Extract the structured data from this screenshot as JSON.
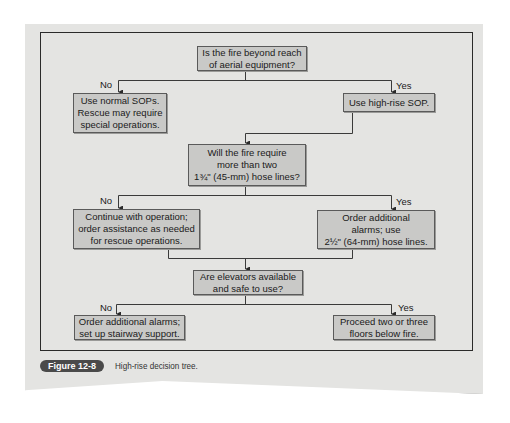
{
  "diagram": {
    "type": "decision-tree",
    "nodes": {
      "q1": {
        "text": "Is the fire beyond reach\nof aerial equipment?"
      },
      "q1_no": {
        "text": "Use normal SOPs.\nRescue may require\nspecial operations."
      },
      "q1_yes": {
        "text": "Use high-rise SOP."
      },
      "q2": {
        "text": "Will the fire require\nmore than two\n1¾\" (45-mm) hose lines?"
      },
      "q2_no": {
        "text": "Continue with operation;\norder assistance as needed\nfor rescue operations."
      },
      "q2_yes": {
        "text": "Order additional\nalarms; use\n2½\" (64-mm) hose lines."
      },
      "q3": {
        "text": "Are elevators available\nand safe to use?"
      },
      "q3_no": {
        "text": "Order additional alarms;\nset up stairway support."
      },
      "q3_yes": {
        "text": "Proceed two or three\nfloors below fire."
      }
    },
    "branch_labels": {
      "no": "No",
      "yes": "Yes"
    },
    "edges": [
      {
        "from": "q1",
        "to": "q1_no",
        "label": "No"
      },
      {
        "from": "q1",
        "to": "q1_yes",
        "label": "Yes"
      },
      {
        "from": "q1_yes",
        "to": "q2"
      },
      {
        "from": "q2",
        "to": "q2_no",
        "label": "No"
      },
      {
        "from": "q2",
        "to": "q2_yes",
        "label": "Yes"
      },
      {
        "from": "q2_no",
        "to": "q3"
      },
      {
        "from": "q2_yes",
        "to": "q3"
      },
      {
        "from": "q3",
        "to": "q3_no",
        "label": "No"
      },
      {
        "from": "q3",
        "to": "q3_yes",
        "label": "Yes"
      }
    ]
  },
  "figure": {
    "number": "Figure 12-8",
    "caption": "High-rise decision tree."
  },
  "colors": {
    "page": "#e4e4e2",
    "node_fill": "#c9c9c7",
    "node_border": "#5a5a5a",
    "line": "#3a3a3a",
    "badge": "#4a4a4a"
  }
}
